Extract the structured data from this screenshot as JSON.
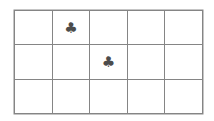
{
  "page": {
    "background_color": "#ffffff",
    "width": 214,
    "height": 121
  },
  "grid": {
    "name": "suit-grid",
    "rows": 3,
    "columns": 5,
    "line_color": "#858585",
    "border_color": "#8a8a8a",
    "cell_background": "#ffffff",
    "left": 14,
    "top": 10,
    "width": 189,
    "height": 104,
    "cells": [
      [
        {
          "content": "",
          "icon": "empty-cell"
        },
        {
          "content": "♣",
          "icon": "club-suit-icon"
        },
        {
          "content": "",
          "icon": "empty-cell"
        },
        {
          "content": "",
          "icon": "empty-cell"
        },
        {
          "content": "",
          "icon": "empty-cell"
        }
      ],
      [
        {
          "content": "",
          "icon": "empty-cell"
        },
        {
          "content": "",
          "icon": "empty-cell"
        },
        {
          "content": "♣",
          "icon": "club-suit-icon"
        },
        {
          "content": "",
          "icon": "empty-cell"
        },
        {
          "content": "",
          "icon": "empty-cell"
        }
      ],
      [
        {
          "content": "",
          "icon": "empty-cell"
        },
        {
          "content": "",
          "icon": "empty-cell"
        },
        {
          "content": "",
          "icon": "empty-cell"
        },
        {
          "content": "",
          "icon": "empty-cell"
        },
        {
          "content": "",
          "icon": "empty-cell"
        }
      ]
    ]
  },
  "symbols": {
    "club": {
      "glyph": "♣",
      "name": "club-suit-icon",
      "color": "#4c4c4c",
      "count": 2,
      "positions": [
        {
          "row": 1,
          "column": 2
        },
        {
          "row": 2,
          "column": 3
        }
      ]
    }
  }
}
